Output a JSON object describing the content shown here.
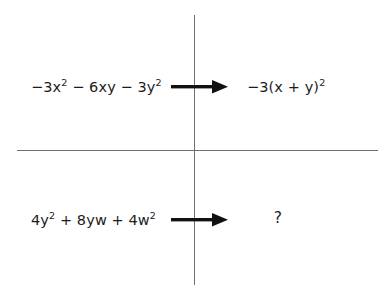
{
  "diagram": {
    "type": "two-row analogy diagram",
    "divider": {
      "vertical_color": "#6f6f6f",
      "horizontal_color": "#6f6f6f"
    },
    "rows": [
      {
        "id": "row-top",
        "input": {
          "text": "−3x² − 6xy − 3y²",
          "parts": [
            "−3x",
            "2",
            " − 6xy − 3y",
            "2"
          ]
        },
        "connector": "right-arrow",
        "output": {
          "text": "−3(x + y)²",
          "parts": [
            "−3(x + y)",
            "2"
          ]
        }
      },
      {
        "id": "row-bottom",
        "input": {
          "text": "4y² + 8yw + 4w²",
          "parts": [
            "4y",
            "2",
            " + 8yw + 4w",
            "2"
          ]
        },
        "connector": "right-arrow",
        "output": {
          "text": "?",
          "parts": [
            "?"
          ]
        }
      }
    ],
    "expressions": {
      "top_left_base_1": "−3x",
      "top_left_exp_1": "2",
      "top_left_base_2": " − 6xy − 3y",
      "top_left_exp_2": "2",
      "top_right_base_1": "−3(x + y)",
      "top_right_exp_1": "2",
      "bottom_left_base_1": "4y",
      "bottom_left_exp_1": "2",
      "bottom_left_base_2": " + 8yw + 4w",
      "bottom_left_exp_2": "2",
      "bottom_right": "?"
    },
    "colors": {
      "background": "#ffffff",
      "text": "#1c1c1c",
      "arrow": "#111111",
      "rule": "#6f6f6f"
    }
  }
}
